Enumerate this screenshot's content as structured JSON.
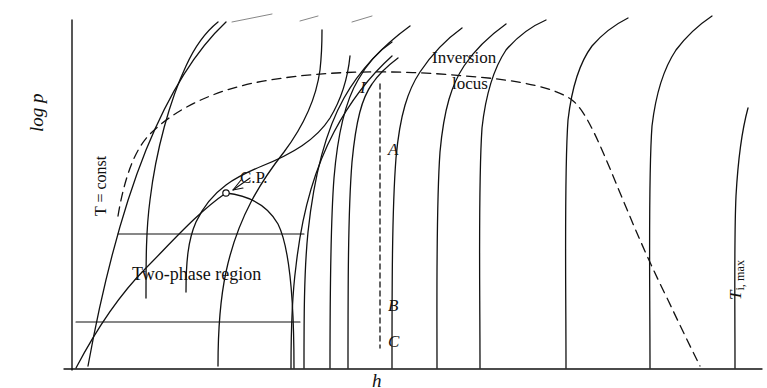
{
  "figure": {
    "kind": "pressure-enthalpy thermodynamic diagram",
    "axes": {
      "y_label": "log p",
      "x_label": "h"
    },
    "labels": {
      "two_phase": "Two-phase region",
      "critical_point": "C.P.",
      "isotherm": "T = const",
      "inversion_line1": "Inversion",
      "inversion_line2": "locus",
      "ti_max_main": "T",
      "ti_max_sub": "i, max",
      "point_I": "I",
      "point_A": "A",
      "point_B": "B",
      "point_C": "C"
    },
    "colors": {
      "ink": "#111111",
      "paper": "#ffffff"
    }
  },
  "chart_data": {
    "type": "line",
    "title": "",
    "xlabel": "h",
    "ylabel": "log p",
    "grid": false,
    "legend": "none",
    "axis_origin_px": [
      72,
      370
    ],
    "axis_extent_px": [
      760,
      20
    ],
    "series": [
      {
        "name": "isotherm-1",
        "role": "isotherm",
        "path": "M 88 366 C 100 300 118 220 146 150 C 168 96 196 50 226 22"
      },
      {
        "name": "isotherm-2",
        "role": "isotherm-T-const",
        "path": "M 146 298 C 146 260 146 230 150 200 C 156 150 170 100 186 66 C 196 44 208 30 218 22"
      },
      {
        "name": "isotherm-3",
        "role": "isotherm",
        "path": "M 186 292 C 186 262 188 240 196 222 C 212 188 238 176 262 166 C 292 154 316 140 330 118 C 342 98 348 76 350 56"
      },
      {
        "name": "isotherm-4",
        "role": "isotherm",
        "path": "M 218 366 C 218 330 220 300 226 272 C 238 216 262 180 284 152 C 302 128 316 100 320 70 C 322 52 322 40 322 30"
      },
      {
        "name": "isotherm-5",
        "role": "isotherm",
        "path": "M 291 368 C 291 330 292 296 296 266 C 302 212 316 166 334 132 C 352 98 372 74 392 56"
      },
      {
        "name": "isotherm-6",
        "role": "isotherm",
        "path": "M 304 368 C 304 320 304 272 308 232 C 314 176 326 130 344 98 C 362 66 388 42 410 26"
      },
      {
        "name": "isotherm-7",
        "role": "isotherm",
        "path": "M 330 368 C 330 300 330 230 334 178 C 338 130 346 100 358 80 C 368 62 380 50 392 42"
      },
      {
        "name": "isotherm-8",
        "role": "isotherm",
        "path": "M 348 368 C 348 290 348 212 352 162 C 356 120 362 98 372 84 C 380 72 390 64 398 58"
      },
      {
        "name": "isotherm-9",
        "role": "isotherm",
        "path": "M 392 368 C 392 290 392 210 396 158 C 400 114 408 90 420 72 C 432 54 448 38 462 28"
      },
      {
        "name": "isotherm-10",
        "role": "isotherm",
        "path": "M 437 368 C 437 290 436 208 440 152 C 444 108 452 84 464 66 C 476 48 492 34 506 24"
      },
      {
        "name": "isotherm-11",
        "role": "isotherm",
        "path": "M 480 368 C 480 280 478 186 482 128 C 486 92 494 68 506 50 C 518 36 532 26 546 20"
      },
      {
        "name": "isotherm-12",
        "role": "isotherm",
        "path": "M 566 368 C 566 280 564 176 568 120 C 572 86 580 62 592 46 C 604 32 616 24 628 18"
      },
      {
        "name": "isotherm-13",
        "role": "isotherm",
        "path": "M 650 368 C 650 280 648 180 652 126 C 656 92 664 68 676 50 C 688 34 700 24 712 16"
      },
      {
        "name": "isotherm-14",
        "role": "isotherm-Ti-max",
        "path": "M 735 368 C 735 300 734 240 736 196 C 738 160 742 130 748 108"
      },
      {
        "name": "dome-left-branch",
        "role": "saturation-liquid",
        "path": "M 76 368 C 96 330 118 296 146 268 C 170 244 198 212 226 193"
      },
      {
        "name": "dome-right-branch",
        "role": "saturation-vapor",
        "path": "M 226 193 C 252 196 268 206 278 224 C 290 248 294 300 294 368"
      },
      {
        "name": "tie-line-upper",
        "role": "tie-line",
        "path": "M 118 234 L 304 234"
      },
      {
        "name": "tie-line-lower",
        "role": "tie-line",
        "path": "M 76 322 L 300 322"
      },
      {
        "name": "inversion-locus",
        "role": "inversion-locus",
        "dashed": true,
        "path": "M 118 216 C 124 180 134 150 150 134 C 176 108 218 88 270 80 C 330 70 400 70 466 76 C 520 80 556 88 572 100 C 596 118 618 200 668 300 C 684 334 694 354 700 366"
      },
      {
        "name": "process-line-I-C",
        "role": "throttling-path",
        "dashed": true,
        "path": "M 380 84 L 380 348"
      }
    ],
    "annotated_points": [
      {
        "label": "C.P.",
        "px": [
          226,
          193
        ],
        "marker": "open-circle"
      },
      {
        "label": "I",
        "px": [
          380,
          90
        ]
      },
      {
        "label": "A",
        "px": [
          380,
          152
        ]
      },
      {
        "label": "B",
        "px": [
          380,
          308
        ]
      },
      {
        "label": "C",
        "px": [
          380,
          344
        ]
      }
    ]
  }
}
